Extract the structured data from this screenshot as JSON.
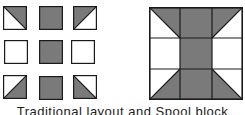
{
  "colors": {
    "fill": "#7a7a7a",
    "stroke": "#1a1a1a",
    "background": "#ffffff"
  },
  "traditional_layout": {
    "pieces": [
      {
        "row": 0,
        "col": 0,
        "type": "hst",
        "shaded": "top-right",
        "diagonal": "tl-br"
      },
      {
        "row": 0,
        "col": 1,
        "type": "solid"
      },
      {
        "row": 0,
        "col": 2,
        "type": "hst",
        "shaded": "top-left",
        "diagonal": "bl-tr"
      },
      {
        "row": 1,
        "col": 0,
        "type": "plain"
      },
      {
        "row": 1,
        "col": 1,
        "type": "solid"
      },
      {
        "row": 1,
        "col": 2,
        "type": "plain"
      },
      {
        "row": 2,
        "col": 0,
        "type": "hst",
        "shaded": "bottom-right",
        "diagonal": "bl-tr"
      },
      {
        "row": 2,
        "col": 1,
        "type": "solid"
      },
      {
        "row": 2,
        "col": 2,
        "type": "hst",
        "shaded": "bottom-left",
        "diagonal": "tl-br"
      }
    ]
  },
  "spool_block": {
    "grid": 3
  },
  "caption": "Traditional layout and Spool block"
}
